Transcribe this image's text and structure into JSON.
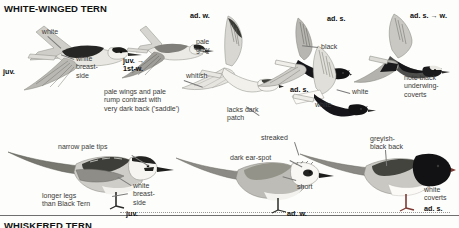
{
  "page": {
    "width": 459,
    "height": 228,
    "background": "#fdfdfb"
  },
  "headings": {
    "main_title": "WHITE-WINGED TERN",
    "next_title": "WHISKERED TERN"
  },
  "colors": {
    "text": "#3a3a3a",
    "age_text": "#0d0d0d",
    "leader": "#7a7a7a",
    "plumage_dark": "#2b2b2b",
    "plumage_black": "#161616",
    "plumage_grey": "#9a9a96",
    "plumage_pale": "#d9d8d2",
    "plumage_white": "#f4f3ef",
    "bill_red": "#8d3a33",
    "leg_red": "#8d3a33"
  },
  "annotations": [
    {
      "id": "a01",
      "text": "white",
      "x": 30,
      "y": 28,
      "w": 40,
      "align": "center",
      "bold": false
    },
    {
      "id": "a02",
      "text": "juv.",
      "x": 3,
      "y": 68,
      "w": 26,
      "align": "left",
      "bold": true
    },
    {
      "id": "a03",
      "text": "white\nbreast-\nside",
      "x": 76,
      "y": 55,
      "w": 40,
      "align": "left",
      "bold": false
    },
    {
      "id": "a04",
      "text": "pale wings and pale\nrump contrast with\nvery dark back ('saddle')",
      "x": 104,
      "y": 88,
      "w": 104,
      "align": "left",
      "bold": false
    },
    {
      "id": "a05",
      "text": "juv. →\n1st-w.",
      "x": 123,
      "y": 57,
      "w": 34,
      "align": "left",
      "bold": true
    },
    {
      "id": "a06",
      "text": "ad. w.",
      "x": 190,
      "y": 12,
      "w": 32,
      "align": "left",
      "bold": true
    },
    {
      "id": "a07",
      "text": "pale\ngrey",
      "x": 196,
      "y": 38,
      "w": 30,
      "align": "left",
      "bold": false
    },
    {
      "id": "a08",
      "text": "whitish",
      "x": 186,
      "y": 72,
      "w": 34,
      "align": "left",
      "bold": false
    },
    {
      "id": "a09",
      "text": "black",
      "x": 321,
      "y": 43,
      "w": 30,
      "align": "left",
      "bold": false
    },
    {
      "id": "a10",
      "text": "ad. s.",
      "x": 290,
      "y": 86,
      "w": 28,
      "align": "left",
      "bold": true
    },
    {
      "id": "a11",
      "text": "ad. s.",
      "x": 327,
      "y": 15,
      "w": 28,
      "align": "left",
      "bold": true
    },
    {
      "id": "a12",
      "text": "white",
      "x": 352,
      "y": 88,
      "w": 30,
      "align": "left",
      "bold": false
    },
    {
      "id": "a13",
      "text": "ad. s. → w.",
      "x": 410,
      "y": 12,
      "w": 48,
      "align": "left",
      "bold": true
    },
    {
      "id": "a14",
      "text": "note black\nunderwing-\ncoverts",
      "x": 404,
      "y": 74,
      "w": 54,
      "align": "left",
      "bold": false
    },
    {
      "id": "a15",
      "text": "narrow pale tips",
      "x": 58,
      "y": 143,
      "w": 72,
      "align": "left",
      "bold": false
    },
    {
      "id": "a16",
      "text": "longer legs\nthan Black Tern",
      "x": 42,
      "y": 192,
      "w": 66,
      "align": "left",
      "bold": false
    },
    {
      "id": "a17",
      "text": "white\nbreast-\nside",
      "x": 133,
      "y": 182,
      "w": 36,
      "align": "left",
      "bold": false
    },
    {
      "id": "a18",
      "text": "juv.",
      "x": 126,
      "y": 210,
      "w": 22,
      "align": "left",
      "bold": true
    },
    {
      "id": "a19",
      "text": "lacks dark\npatch",
      "x": 227,
      "y": 106,
      "w": 48,
      "align": "left",
      "bold": false
    },
    {
      "id": "a20",
      "text": "streaked",
      "x": 261,
      "y": 134,
      "w": 42,
      "align": "left",
      "bold": false
    },
    {
      "id": "a21",
      "text": "dark ear-spot",
      "x": 230,
      "y": 154,
      "w": 58,
      "align": "left",
      "bold": false
    },
    {
      "id": "a22",
      "text": "short",
      "x": 297,
      "y": 183,
      "w": 28,
      "align": "left",
      "bold": false
    },
    {
      "id": "a23",
      "text": "ad. w.",
      "x": 287,
      "y": 210,
      "w": 30,
      "align": "left",
      "bold": true
    },
    {
      "id": "a24",
      "text": "white",
      "x": 315,
      "y": 101,
      "w": 30,
      "align": "left",
      "bold": false
    },
    {
      "id": "a25",
      "text": "greyish-\nblack back",
      "x": 370,
      "y": 135,
      "w": 48,
      "align": "left",
      "bold": false
    },
    {
      "id": "a26",
      "text": "white\ncoverts",
      "x": 424,
      "y": 186,
      "w": 34,
      "align": "left",
      "bold": false
    },
    {
      "id": "a27",
      "text": "ad. s.",
      "x": 424,
      "y": 205,
      "w": 28,
      "align": "left",
      "bold": true
    }
  ],
  "leaders": [
    {
      "id": "l01",
      "x": 48,
      "y": 36,
      "len": 18,
      "angle": 42
    },
    {
      "id": "l02",
      "x": 74,
      "y": 60,
      "len": 14,
      "angle": 200
    },
    {
      "id": "l03",
      "x": 132,
      "y": 155,
      "len": 20,
      "angle": 32
    },
    {
      "id": "l04",
      "x": 112,
      "y": 196,
      "len": 16,
      "angle": 350
    },
    {
      "id": "l05",
      "x": 131,
      "y": 186,
      "len": 16,
      "angle": 212
    },
    {
      "id": "l06",
      "x": 194,
      "y": 48,
      "len": 16,
      "angle": 18
    },
    {
      "id": "l07",
      "x": 184,
      "y": 80,
      "len": 20,
      "angle": 20
    },
    {
      "id": "l08",
      "x": 318,
      "y": 48,
      "len": 16,
      "angle": 186
    },
    {
      "id": "l09",
      "x": 350,
      "y": 94,
      "len": 14,
      "angle": 196
    },
    {
      "id": "l10",
      "x": 259,
      "y": 116,
      "len": 16,
      "angle": 214
    },
    {
      "id": "l11",
      "x": 295,
      "y": 142,
      "len": 14,
      "angle": 72
    },
    {
      "id": "l12",
      "x": 290,
      "y": 160,
      "len": 14,
      "angle": 28
    },
    {
      "id": "l13",
      "x": 296,
      "y": 181,
      "len": 14,
      "angle": 196
    },
    {
      "id": "l14",
      "x": 386,
      "y": 150,
      "len": 16,
      "angle": 86
    }
  ],
  "birds": [
    {
      "id": "b1",
      "name": "juvenile-flying-upper",
      "age": "juv."
    },
    {
      "id": "b2",
      "name": "juvenile-1st-winter-flying",
      "age": "juv. → 1st-w."
    },
    {
      "id": "b3",
      "name": "adult-winter-flying",
      "age": "ad. w."
    },
    {
      "id": "b4",
      "name": "adult-summer-flying-upper",
      "age": "ad. s."
    },
    {
      "id": "b5",
      "name": "adult-summer-flying-lower",
      "age": "ad. s."
    },
    {
      "id": "b6",
      "name": "adult-summer-to-winter-flying",
      "age": "ad. s. → w."
    },
    {
      "id": "b7",
      "name": "juvenile-perched",
      "age": "juv."
    },
    {
      "id": "b8",
      "name": "adult-winter-perched",
      "age": "ad. w."
    },
    {
      "id": "b9",
      "name": "adult-summer-perched",
      "age": "ad. s."
    }
  ]
}
